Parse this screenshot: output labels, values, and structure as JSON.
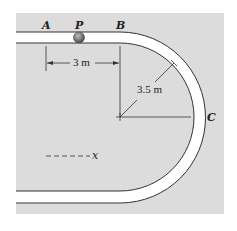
{
  "figure": {
    "type": "track-diagram",
    "colors": {
      "background": "#dcdcdc",
      "track": "#ffffff",
      "line": "#333333",
      "ball": "#7a7a7a"
    },
    "points": {
      "A": "A",
      "P": "P",
      "B": "B",
      "C": "C"
    },
    "dimensions": {
      "straight_length": "3 m",
      "radius": "3.5 m"
    },
    "axis_label": "x",
    "axis_style": "- - - -"
  }
}
